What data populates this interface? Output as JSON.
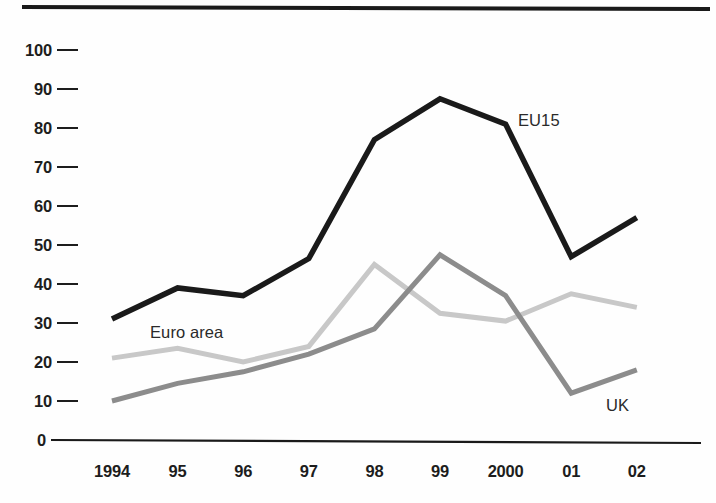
{
  "chart_data": {
    "type": "line",
    "title": "",
    "subtitle": "",
    "xlabel": "",
    "ylabel": "",
    "x": [
      "1994",
      "95",
      "96",
      "97",
      "98",
      "99",
      "2000",
      "01",
      "02"
    ],
    "categories": [
      "1994",
      "95",
      "96",
      "97",
      "98",
      "99",
      "2000",
      "01",
      "02"
    ],
    "xtick_labels": [
      "1994",
      "95",
      "96",
      "97",
      "98",
      "99",
      "2000",
      "01",
      "02"
    ],
    "ytick_labels": [
      "0",
      "10",
      "20",
      "30",
      "40",
      "50",
      "60",
      "70",
      "80",
      "90",
      "100"
    ],
    "ytick_values": [
      0,
      10,
      20,
      30,
      40,
      50,
      60,
      70,
      80,
      90,
      100
    ],
    "ylim": [
      0,
      100
    ],
    "grid": false,
    "legend_position": "inline-annotations",
    "series": [
      {
        "name": "EU15",
        "color": "#1a1a1a",
        "stroke_width": 5.5,
        "values": [
          31,
          39,
          37,
          46.5,
          77,
          87.5,
          81,
          47,
          57
        ],
        "label_x": 518,
        "label_y": 126
      },
      {
        "name": "Euro area",
        "color": "#c8c8c8",
        "stroke_width": 5,
        "values": [
          21,
          23.5,
          20,
          24,
          45,
          32.5,
          30.5,
          37.5,
          34
        ],
        "label_x": 150,
        "label_y": 338
      },
      {
        "name": "UK",
        "color": "#8c8c8c",
        "stroke_width": 5,
        "values": [
          10,
          14.5,
          17.5,
          22,
          28.5,
          47.5,
          37,
          12,
          18
        ],
        "label_x": 606,
        "label_y": 411
      }
    ],
    "annotations": [
      {
        "text": "EU15",
        "series": "EU15"
      },
      {
        "text": "Euro area",
        "series": "Euro area"
      },
      {
        "text": "UK",
        "series": "UK"
      }
    ]
  },
  "axes": {
    "top_rule_color": "#1a1a1a",
    "baseline_color": "#1a1a1a",
    "tick_color": "#1d1d1d"
  }
}
